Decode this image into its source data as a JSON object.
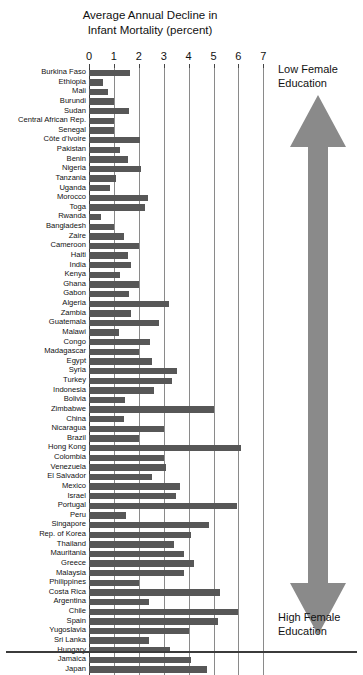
{
  "chart_data": {
    "type": "bar",
    "orientation": "horizontal",
    "title": "Average Annual Decline in Infant Mortality (percent)",
    "title_lines": [
      "Average Annual Decline in",
      "Infant Mortality (percent)"
    ],
    "xlabel": "",
    "ylabel": "",
    "xlim": [
      0,
      7
    ],
    "ticks": [
      0,
      1,
      2,
      3,
      4,
      5,
      6,
      7
    ],
    "tick_labels": [
      "0",
      "1",
      "2",
      "3",
      "4",
      "5",
      "6",
      "7"
    ],
    "grid": "vertical",
    "legend": "none",
    "bar_color": "#575757",
    "grid_color": "#8a8a8a",
    "categories": [
      "Burkina Faso",
      "Ethiopia",
      "Mali",
      "Burundi",
      "Sudan",
      "Central African Rep.",
      "Senegal",
      "Côte d'Ivoire",
      "Pakistan",
      "Benin",
      "Nigeria",
      "Tanzania",
      "Uganda",
      "Morocco",
      "Toga",
      "Rwanda",
      "Bangladesh",
      "Zaire",
      "Cameroon",
      "Haiti",
      "India",
      "Kenya",
      "Ghana",
      "Gabon",
      "Algeria",
      "Zambia",
      "Guatemala",
      "Malawi",
      "Congo",
      "Madagascar",
      "Egypt",
      "Syria",
      "Turkey",
      "Indonesia",
      "Bolivia",
      "Zimbabwe",
      "China",
      "Nicaragua",
      "Brazil",
      "Hong Kong",
      "Colombia",
      "Venezuela",
      "El Salvador",
      "Mexico",
      "Israel",
      "Portugal",
      "Peru",
      "Singapore",
      "Rep. of Korea",
      "Thailand",
      "Mauritania",
      "Greece",
      "Malaysia",
      "Philippines",
      "Costa Rica",
      "Argentina",
      "Chile",
      "Spain",
      "Yugoslavia",
      "Sri Lanka",
      "Hungary",
      "Jamaica",
      "Japan"
    ],
    "values": [
      1.65,
      0.55,
      0.75,
      1.0,
      1.6,
      1.0,
      1.0,
      2.05,
      1.25,
      1.55,
      2.1,
      1.1,
      0.85,
      2.35,
      2.25,
      0.5,
      1.0,
      1.4,
      2.0,
      1.55,
      1.7,
      1.25,
      2.0,
      1.6,
      3.2,
      1.7,
      2.8,
      1.2,
      2.45,
      2.0,
      2.55,
      3.55,
      3.35,
      2.6,
      1.45,
      5.0,
      1.4,
      3.0,
      2.0,
      6.1,
      3.0,
      3.1,
      2.55,
      3.65,
      3.5,
      5.95,
      1.5,
      4.8,
      4.1,
      3.4,
      3.8,
      4.2,
      3.8,
      2.0,
      5.25,
      2.4,
      6.0,
      5.2,
      4.0,
      2.4,
      3.25,
      4.1,
      4.75
    ]
  },
  "annotation": {
    "top_lines": [
      "Low Female",
      "Education"
    ],
    "bottom_lines": [
      "High Female",
      "Education"
    ],
    "arrow_color": "#8a8a8a",
    "icon": "double-headed-vertical-arrow"
  }
}
